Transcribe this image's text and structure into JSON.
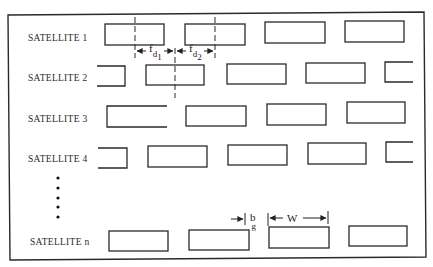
{
  "diagram": {
    "type": "satellite-frequency-channel-layout",
    "frame_color": "#2a2a2a",
    "rows": [
      {
        "label": "SATELLITE 1",
        "y": 24
      },
      {
        "label": "SATELLITE 2",
        "y": 65
      },
      {
        "label": "SATELLITE 3",
        "y": 105
      },
      {
        "label": "SATELLITE 4",
        "y": 146
      },
      {
        "label": "SATELLITE n",
        "y": 230
      }
    ],
    "ellipsis_dots": 5,
    "annotations": {
      "fd1_main": "f",
      "fd1_sub": "d",
      "fd1_subsub": "1",
      "fd2_main": "f",
      "fd2_sub": "d",
      "fd2_subsub": "2",
      "bg_main": "b",
      "bg_sub": "g",
      "w_label": "W"
    }
  }
}
